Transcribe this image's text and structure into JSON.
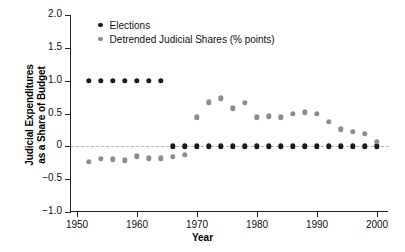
{
  "chart_data": {
    "type": "scatter",
    "title": "",
    "xlabel": "Year",
    "ylabel": "Judicial Expenditures as a Share of Budget",
    "ylabel_line1": "Judicial Expenditures",
    "ylabel_line2": "as a Share of Budget",
    "xlim": [
      1949,
      2002
    ],
    "ylim": [
      -1.0,
      2.0
    ],
    "grid": false,
    "zero_reference_line": true,
    "legend_position": "top-left",
    "x_ticks": [
      1950,
      1960,
      1970,
      1980,
      1990,
      2000
    ],
    "x_tick_labels": [
      "1950",
      "1960",
      "1970",
      "1980",
      "1990",
      "2000"
    ],
    "y_ticks": [
      -1.0,
      -0.5,
      0,
      0.5,
      1.0,
      1.5,
      2.0
    ],
    "y_tick_labels": [
      "−1.0",
      "−0.5",
      "0",
      "0.5",
      "1.0",
      "1.5",
      "2.0"
    ],
    "series": [
      {
        "name": "Elections",
        "color": "#1a1a1a",
        "marker": "circle",
        "x": [
          1952,
          1954,
          1956,
          1958,
          1960,
          1962,
          1964,
          1966,
          1968,
          1970,
          1972,
          1974,
          1976,
          1978,
          1980,
          1982,
          1984,
          1986,
          1988,
          1990,
          1992,
          1994,
          1996,
          1998,
          2000
        ],
        "values": [
          1.0,
          1.0,
          1.0,
          1.0,
          1.0,
          1.0,
          1.0,
          0,
          0,
          0,
          0,
          0,
          0,
          0,
          0,
          0,
          0,
          0,
          0,
          0,
          0,
          0,
          0,
          0,
          0
        ]
      },
      {
        "name": "Detrended Judicial Shares (% points)",
        "color": "#8c8c8c",
        "marker": "circle",
        "x": [
          1952,
          1954,
          1956,
          1958,
          1960,
          1962,
          1964,
          1966,
          1968,
          1970,
          1972,
          1974,
          1976,
          1978,
          1980,
          1982,
          1984,
          1986,
          1988,
          1990,
          1992,
          1994,
          1996,
          1998,
          2000
        ],
        "values": [
          -0.24,
          -0.19,
          -0.2,
          -0.21,
          -0.15,
          -0.18,
          -0.18,
          -0.16,
          -0.13,
          0.44,
          0.67,
          0.73,
          0.58,
          0.66,
          0.44,
          0.46,
          0.44,
          0.5,
          0.52,
          0.5,
          0.37,
          0.26,
          0.22,
          0.19,
          0.07
        ]
      }
    ]
  },
  "legend": {
    "items": [
      {
        "label": "Elections",
        "color": "#1a1a1a"
      },
      {
        "label": "Detrended Judicial Shares (% points)",
        "color": "#8c8c8c"
      }
    ]
  }
}
